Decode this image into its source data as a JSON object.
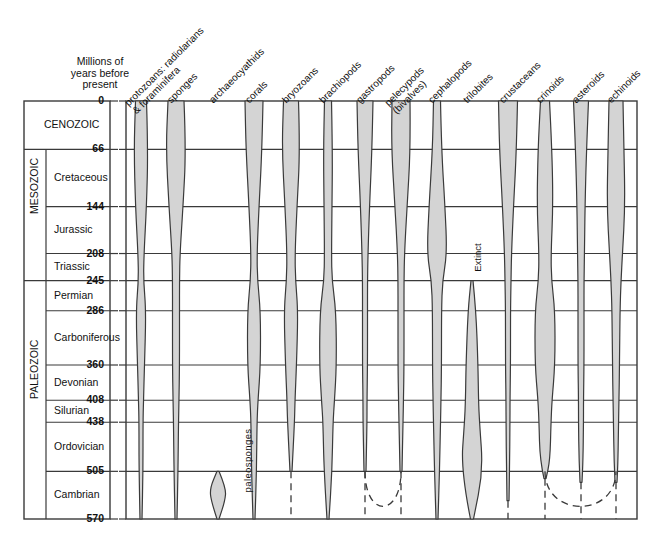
{
  "figure": {
    "type": "geologic-range-spindle-diagram",
    "axis_caption": "Millions of\nyears before\npresent",
    "fill_color": "#d4d4d4",
    "stroke_color": "#3a3a3a",
    "background": "#ffffff"
  },
  "chart_data": {
    "type": "area",
    "title": "Millions of years before present",
    "xlabel": "",
    "ylabel": "Millions of years before present",
    "ylim": [
      0,
      570
    ],
    "y_axis_inverted": true,
    "grid": true,
    "legend": "none",
    "tick_values": [
      0,
      66,
      144,
      208,
      245,
      286,
      360,
      408,
      438,
      505,
      570
    ],
    "tick_labels": [
      "0",
      "66",
      "144",
      "208",
      "245",
      "286",
      "360",
      "408",
      "438",
      "505",
      "570"
    ],
    "eras": [
      {
        "name": "CENOZOIC",
        "from": 0,
        "to": 66
      },
      {
        "name": "MESOZOIC",
        "from": 66,
        "to": 245
      },
      {
        "name": "PALEOZOIC",
        "from": 245,
        "to": 570
      }
    ],
    "periods": [
      {
        "name": "Cretaceous",
        "from": 66,
        "to": 144
      },
      {
        "name": "Jurassic",
        "from": 144,
        "to": 208
      },
      {
        "name": "Triassic",
        "from": 208,
        "to": 245
      },
      {
        "name": "Permian",
        "from": 245,
        "to": 286
      },
      {
        "name": "Carboniferous",
        "from": 286,
        "to": 360
      },
      {
        "name": "Devonian",
        "from": 360,
        "to": 408
      },
      {
        "name": "Silurian",
        "from": 408,
        "to": 438
      },
      {
        "name": "Ordovician",
        "from": 438,
        "to": 505
      },
      {
        "name": "Cambrian",
        "from": 505,
        "to": 570
      }
    ],
    "categories": [
      "protozoans: radiolarians & foraminifera",
      "sponges",
      "archaeocyathids",
      "corals",
      "bryozoans",
      "brachiopods",
      "gastropods",
      "pelecypods (bivalves)",
      "cephalopods",
      "trilobites",
      "crustaceans",
      "crinoids",
      "asteroids",
      "echinoids"
    ],
    "series": [
      {
        "name": "protozoans: radiolarians & foraminifera",
        "label": "protozoans: radiolarians\n& foraminifera",
        "center_x": 141,
        "extinct": false,
        "dashed_extension": false,
        "widths": [
          {
            "age": 0,
            "w": 11
          },
          {
            "age": 66,
            "w": 14
          },
          {
            "age": 144,
            "w": 11
          },
          {
            "age": 208,
            "w": 6
          },
          {
            "age": 245,
            "w": 5
          },
          {
            "age": 286,
            "w": 10
          },
          {
            "age": 360,
            "w": 7
          },
          {
            "age": 408,
            "w": 5
          },
          {
            "age": 438,
            "w": 4
          },
          {
            "age": 505,
            "w": 4
          },
          {
            "age": 570,
            "w": 2
          }
        ]
      },
      {
        "name": "sponges",
        "label": "sponges",
        "center_x": 176,
        "extinct": false,
        "dashed_extension": false,
        "widths": [
          {
            "age": 0,
            "w": 16
          },
          {
            "age": 66,
            "w": 20
          },
          {
            "age": 144,
            "w": 14
          },
          {
            "age": 208,
            "w": 8
          },
          {
            "age": 245,
            "w": 7
          },
          {
            "age": 286,
            "w": 7
          },
          {
            "age": 360,
            "w": 7
          },
          {
            "age": 408,
            "w": 6
          },
          {
            "age": 438,
            "w": 5
          },
          {
            "age": 505,
            "w": 4
          },
          {
            "age": 570,
            "w": 2
          }
        ]
      },
      {
        "name": "archaeocyathids",
        "label": "archaeocyathids",
        "center_x": 218,
        "extinct": true,
        "annotation": "paleosponges",
        "annotation_x": 216,
        "annotation_y": 455,
        "dashed_extension": false,
        "range_from": 505,
        "range_to": 570,
        "widths": [
          {
            "age": 505,
            "w": 2
          },
          {
            "age": 528,
            "w": 16
          },
          {
            "age": 545,
            "w": 14
          },
          {
            "age": 570,
            "w": 2
          }
        ]
      },
      {
        "name": "corals",
        "label": "corals",
        "center_x": 254,
        "extinct": false,
        "dashed_extension": false,
        "widths": [
          {
            "age": 0,
            "w": 18
          },
          {
            "age": 66,
            "w": 16
          },
          {
            "age": 144,
            "w": 10
          },
          {
            "age": 208,
            "w": 6
          },
          {
            "age": 245,
            "w": 7
          },
          {
            "age": 286,
            "w": 13
          },
          {
            "age": 360,
            "w": 13
          },
          {
            "age": 408,
            "w": 8
          },
          {
            "age": 438,
            "w": 6
          },
          {
            "age": 505,
            "w": 5
          },
          {
            "age": 570,
            "w": 2
          }
        ]
      },
      {
        "name": "bryozoans",
        "label": "bryozoans",
        "center_x": 291,
        "extinct": false,
        "dashed_extension": true,
        "dash_to": 570,
        "solid_to": 505,
        "widths": [
          {
            "age": 0,
            "w": 15
          },
          {
            "age": 66,
            "w": 18
          },
          {
            "age": 144,
            "w": 12
          },
          {
            "age": 208,
            "w": 8
          },
          {
            "age": 245,
            "w": 9
          },
          {
            "age": 286,
            "w": 14
          },
          {
            "age": 360,
            "w": 11
          },
          {
            "age": 408,
            "w": 8
          },
          {
            "age": 438,
            "w": 7
          },
          {
            "age": 505,
            "w": 2
          }
        ]
      },
      {
        "name": "brachiopods",
        "label": "brachiopods",
        "center_x": 328,
        "extinct": false,
        "dashed_extension": false,
        "widths": [
          {
            "age": 0,
            "w": 7
          },
          {
            "age": 66,
            "w": 9
          },
          {
            "age": 144,
            "w": 8
          },
          {
            "age": 208,
            "w": 7
          },
          {
            "age": 245,
            "w": 8
          },
          {
            "age": 286,
            "w": 16
          },
          {
            "age": 360,
            "w": 17
          },
          {
            "age": 408,
            "w": 13
          },
          {
            "age": 438,
            "w": 10
          },
          {
            "age": 505,
            "w": 8
          },
          {
            "age": 570,
            "w": 2
          }
        ]
      },
      {
        "name": "gastropods",
        "label": "gastropods",
        "center_x": 365,
        "extinct": false,
        "dashed_extension": true,
        "dash_to": 570,
        "solid_to": 505,
        "dash_arc_partner": "pelecypods (bivalves)",
        "widths": [
          {
            "age": 0,
            "w": 16
          },
          {
            "age": 66,
            "w": 14
          },
          {
            "age": 144,
            "w": 9
          },
          {
            "age": 208,
            "w": 6
          },
          {
            "age": 245,
            "w": 5
          },
          {
            "age": 286,
            "w": 5
          },
          {
            "age": 360,
            "w": 5
          },
          {
            "age": 408,
            "w": 4
          },
          {
            "age": 438,
            "w": 4
          },
          {
            "age": 505,
            "w": 2
          }
        ]
      },
      {
        "name": "pelecypods (bivalves)",
        "label": "pelecypods\n(bivalves)",
        "center_x": 401,
        "extinct": false,
        "dashed_extension": true,
        "dash_to": 570,
        "solid_to": 505,
        "widths": [
          {
            "age": 0,
            "w": 18
          },
          {
            "age": 66,
            "w": 19
          },
          {
            "age": 144,
            "w": 12
          },
          {
            "age": 208,
            "w": 7
          },
          {
            "age": 245,
            "w": 6
          },
          {
            "age": 286,
            "w": 6
          },
          {
            "age": 360,
            "w": 6
          },
          {
            "age": 408,
            "w": 5
          },
          {
            "age": 438,
            "w": 4
          },
          {
            "age": 505,
            "w": 2
          }
        ]
      },
      {
        "name": "cephalopods",
        "label": "cephalopods",
        "center_x": 437,
        "extinct": false,
        "dashed_extension": false,
        "widths": [
          {
            "age": 0,
            "w": 7
          },
          {
            "age": 66,
            "w": 9
          },
          {
            "age": 144,
            "w": 16
          },
          {
            "age": 208,
            "w": 20
          },
          {
            "age": 245,
            "w": 11
          },
          {
            "age": 286,
            "w": 9
          },
          {
            "age": 360,
            "w": 9
          },
          {
            "age": 408,
            "w": 8
          },
          {
            "age": 438,
            "w": 7
          },
          {
            "age": 505,
            "w": 5
          },
          {
            "age": 570,
            "w": 2
          }
        ]
      },
      {
        "name": "trilobites",
        "label": "trilobites",
        "center_x": 472,
        "extinct": true,
        "annotation": "Extinct",
        "annotation_x": 463,
        "annotation_y": 252,
        "dashed_extension": false,
        "range_from": 245,
        "range_to": 570,
        "widths": [
          {
            "age": 245,
            "w": 2
          },
          {
            "age": 286,
            "w": 8
          },
          {
            "age": 360,
            "w": 12
          },
          {
            "age": 408,
            "w": 13
          },
          {
            "age": 438,
            "w": 15
          },
          {
            "age": 505,
            "w": 22
          },
          {
            "age": 570,
            "w": 3
          }
        ]
      },
      {
        "name": "crustaceans",
        "label": "crustaceans",
        "center_x": 508,
        "extinct": false,
        "dashed_extension": true,
        "dash_to": 570,
        "solid_to": 545,
        "widths": [
          {
            "age": 0,
            "w": 19
          },
          {
            "age": 66,
            "w": 17
          },
          {
            "age": 144,
            "w": 11
          },
          {
            "age": 208,
            "w": 7
          },
          {
            "age": 245,
            "w": 6
          },
          {
            "age": 286,
            "w": 5
          },
          {
            "age": 360,
            "w": 5
          },
          {
            "age": 408,
            "w": 4
          },
          {
            "age": 438,
            "w": 4
          },
          {
            "age": 505,
            "w": 3
          },
          {
            "age": 545,
            "w": 2
          }
        ]
      },
      {
        "name": "crinoids",
        "label": "crinoids",
        "center_x": 545,
        "extinct": false,
        "dashed_extension": true,
        "dash_to": 570,
        "solid_to": 515,
        "widths": [
          {
            "age": 0,
            "w": 9
          },
          {
            "age": 66,
            "w": 14
          },
          {
            "age": 144,
            "w": 16
          },
          {
            "age": 208,
            "w": 12
          },
          {
            "age": 245,
            "w": 13
          },
          {
            "age": 286,
            "w": 20
          },
          {
            "age": 360,
            "w": 20
          },
          {
            "age": 408,
            "w": 14
          },
          {
            "age": 438,
            "w": 12
          },
          {
            "age": 490,
            "w": 10
          },
          {
            "age": 515,
            "w": 2
          }
        ]
      },
      {
        "name": "asteroids",
        "label": "asteroids",
        "center_x": 581,
        "extinct": false,
        "dashed_extension": true,
        "dash_to": 570,
        "solid_to": 520,
        "widths": [
          {
            "age": 0,
            "w": 15
          },
          {
            "age": 66,
            "w": 11
          },
          {
            "age": 144,
            "w": 8
          },
          {
            "age": 208,
            "w": 7
          },
          {
            "age": 245,
            "w": 6
          },
          {
            "age": 286,
            "w": 6
          },
          {
            "age": 360,
            "w": 6
          },
          {
            "age": 408,
            "w": 5
          },
          {
            "age": 438,
            "w": 5
          },
          {
            "age": 490,
            "w": 4
          },
          {
            "age": 520,
            "w": 2
          }
        ]
      },
      {
        "name": "echinoids",
        "label": "echinoids",
        "center_x": 616,
        "extinct": false,
        "dashed_extension": true,
        "dash_to": 570,
        "solid_to": 520,
        "widths": [
          {
            "age": 0,
            "w": 14
          },
          {
            "age": 66,
            "w": 16
          },
          {
            "age": 144,
            "w": 18
          },
          {
            "age": 208,
            "w": 13
          },
          {
            "age": 245,
            "w": 10
          },
          {
            "age": 286,
            "w": 8
          },
          {
            "age": 360,
            "w": 7
          },
          {
            "age": 408,
            "w": 6
          },
          {
            "age": 438,
            "w": 5
          },
          {
            "age": 490,
            "w": 4
          },
          {
            "age": 520,
            "w": 2
          }
        ]
      }
    ],
    "dashed_arcs": [
      {
        "from_series": "gastropods",
        "to_series": "pelecypods (bivalves)",
        "via": "brachiopods"
      },
      {
        "from_series": "crinoids",
        "to_series": "echinoids",
        "via": "asteroids"
      }
    ]
  }
}
